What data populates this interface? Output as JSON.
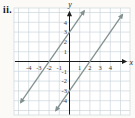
{
  "figure_label": "ii.",
  "colors": {
    "background": "#fbfaf7",
    "plot_background": "#ffffff",
    "grid": "#ccd6db",
    "axis": "#1c1c1c",
    "tick_label": "#3a3a3a",
    "line": "#82918f"
  },
  "chart_data": {
    "type": "line",
    "title": "",
    "xlabel": "x",
    "ylabel": "y",
    "xlim": [
      -5.4,
      5.9
    ],
    "ylim": [
      -5.5,
      5.5
    ],
    "grid": true,
    "x_ticks": [
      -4,
      -3,
      -2,
      -1,
      1,
      2,
      3,
      4
    ],
    "y_ticks": [
      -4,
      -3,
      -2,
      -1,
      1,
      2,
      3,
      4
    ],
    "series": [
      {
        "name": "y = 1.5x + 3",
        "slope": 1.5,
        "intercept": 3,
        "x_intercept": -2,
        "y_intercept": 3,
        "x_range": [
          -4.8,
          1.45
        ],
        "points": [
          [
            -2,
            0
          ],
          [
            0,
            3
          ]
        ]
      },
      {
        "name": "y = 1.5x - 3",
        "slope": 1.5,
        "intercept": -3,
        "x_intercept": 2,
        "y_intercept": -3,
        "x_range": [
          -1.35,
          5.2
        ],
        "points": [
          [
            0,
            -3
          ],
          [
            2,
            0
          ]
        ]
      }
    ]
  }
}
